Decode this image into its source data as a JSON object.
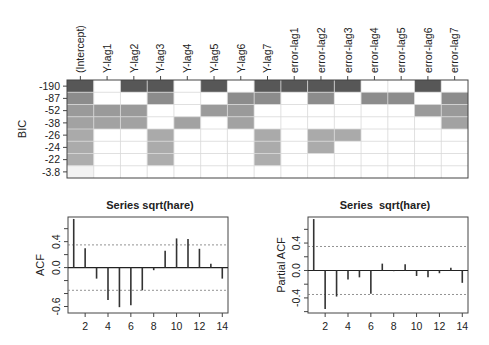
{
  "chart_data": [
    {
      "type": "heatmap",
      "title": "",
      "ylabel": "BIC",
      "columns": [
        "(Intercept)",
        "Y-lag1",
        "Y-lag2",
        "Y-lag3",
        "Y-lag4",
        "Y-lag5",
        "Y-lag6",
        "Y-lag7",
        "error-lag1",
        "error-lag2",
        "error-lag3",
        "error-lag4",
        "error-lag5",
        "error-lag6",
        "error-lag7"
      ],
      "rows": [
        {
          "bic": "-190",
          "shade": "#575757",
          "included": [
            1,
            0,
            1,
            1,
            0,
            1,
            0,
            1,
            1,
            1,
            1,
            0,
            0,
            1,
            0
          ]
        },
        {
          "bic": "-87",
          "shade": "#8c8c8c",
          "included": [
            1,
            0,
            0,
            1,
            0,
            0,
            1,
            1,
            0,
            1,
            0,
            1,
            1,
            0,
            1
          ]
        },
        {
          "bic": "-52",
          "shade": "#9a9a9a",
          "included": [
            1,
            1,
            1,
            0,
            0,
            1,
            1,
            0,
            0,
            0,
            0,
            0,
            0,
            1,
            1
          ]
        },
        {
          "bic": "-38",
          "shade": "#a2a2a2",
          "included": [
            1,
            1,
            1,
            0,
            1,
            0,
            1,
            0,
            0,
            0,
            0,
            0,
            0,
            0,
            1
          ]
        },
        {
          "bic": "-26",
          "shade": "#aaaaaa",
          "included": [
            1,
            0,
            0,
            1,
            0,
            0,
            0,
            1,
            0,
            1,
            1,
            0,
            0,
            0,
            0
          ]
        },
        {
          "bic": "-24",
          "shade": "#ababab",
          "included": [
            1,
            0,
            0,
            1,
            0,
            0,
            0,
            1,
            0,
            1,
            0,
            0,
            0,
            0,
            0
          ]
        },
        {
          "bic": "-22",
          "shade": "#adadad",
          "included": [
            1,
            0,
            0,
            1,
            0,
            0,
            0,
            1,
            0,
            0,
            0,
            0,
            0,
            0,
            0
          ]
        },
        {
          "bic": "-3.8",
          "shade": "#f3f3f3",
          "included": [
            1,
            0,
            0,
            0,
            0,
            0,
            0,
            0,
            0,
            0,
            0,
            0,
            0,
            0,
            0
          ]
        }
      ]
    },
    {
      "type": "bar",
      "subtype": "acf",
      "title": "Series sqrt(hare)",
      "xlabel": "",
      "ylabel": "ACF",
      "x": [
        1,
        2,
        3,
        4,
        5,
        6,
        7,
        8,
        9,
        10,
        11,
        12,
        13,
        14
      ],
      "values": [
        0.75,
        0.3,
        -0.17,
        -0.5,
        -0.61,
        -0.58,
        -0.35,
        -0.04,
        0.26,
        0.45,
        0.44,
        0.29,
        0.06,
        -0.17
      ],
      "confidence_bound": 0.35,
      "xticks": [
        "2",
        "4",
        "6",
        "8",
        "10",
        "12",
        "14"
      ],
      "yticks": [
        "-0.6",
        "0.0",
        "0.4"
      ],
      "xlim": [
        0.5,
        14.5
      ],
      "ylim": [
        -0.7,
        0.78
      ]
    },
    {
      "type": "bar",
      "subtype": "pacf",
      "title": "Series  sqrt(hare)",
      "xlabel": "",
      "ylabel": "Partial ACF",
      "x": [
        1,
        2,
        3,
        4,
        5,
        6,
        7,
        8,
        9,
        10,
        11,
        12,
        13,
        14
      ],
      "values": [
        0.75,
        -0.56,
        -0.38,
        -0.13,
        -0.1,
        -0.34,
        0.1,
        -0.01,
        0.09,
        -0.08,
        -0.1,
        -0.04,
        0.04,
        -0.18
      ],
      "confidence_bound": 0.35,
      "xticks": [
        "2",
        "4",
        "6",
        "8",
        "10",
        "12",
        "14"
      ],
      "yticks": [
        "-0.4",
        "0.0",
        "0.4"
      ],
      "xlim": [
        0.5,
        14.5
      ],
      "ylim": [
        -0.62,
        0.78
      ]
    }
  ]
}
